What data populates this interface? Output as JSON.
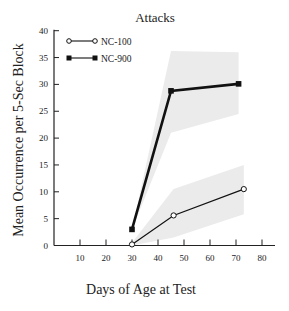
{
  "chart_data": {
    "type": "line",
    "title": "Attacks",
    "xlabel": "Days of Age at Test",
    "ylabel": "Mean Occurrence per 5-Sec Block",
    "xlim": [
      0,
      85
    ],
    "ylim": [
      0,
      40
    ],
    "x_ticks": [
      10,
      20,
      30,
      40,
      50,
      60,
      70,
      80
    ],
    "y_ticks": [
      0,
      5,
      10,
      15,
      20,
      25,
      30,
      35,
      40
    ],
    "grid": false,
    "legend_position": "upper-left",
    "series": [
      {
        "name": "NC-100",
        "marker": "open-circle",
        "line_width": "thin",
        "x": [
          30,
          46,
          73
        ],
        "values": [
          0.2,
          5.6,
          10.5
        ],
        "band_upper": [
          0.5,
          10.5,
          15
        ],
        "band_lower": [
          0,
          1.5,
          5.8
        ]
      },
      {
        "name": "NC-900",
        "marker": "filled-square",
        "line_width": "thick",
        "x": [
          30,
          45,
          71
        ],
        "values": [
          3,
          28.8,
          30.1
        ],
        "band_upper": [
          3,
          36.2,
          36
        ],
        "band_lower": [
          3,
          21,
          24.5
        ]
      }
    ]
  },
  "legend": {
    "items": [
      {
        "label": "NC-100"
      },
      {
        "label": "NC-900"
      }
    ]
  }
}
